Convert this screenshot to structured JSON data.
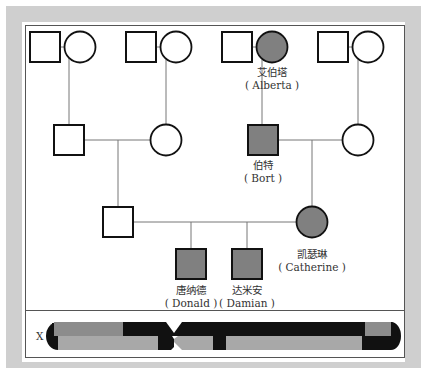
{
  "diagram": {
    "type": "pedigree",
    "colors": {
      "affected_fill": "#808080",
      "unaffected_fill": "#ffffff",
      "stroke": "#111111",
      "line": "#777777",
      "frame": "#cfcfcf",
      "chromosome_black": "#111111",
      "chromosome_dark_gray": "#8c8c8c",
      "chromosome_light_gray": "#a8a8a8"
    },
    "generations": [
      {
        "row": 1,
        "individuals": [
          {
            "id": "g1-m1",
            "sex": "male",
            "affected": false
          },
          {
            "id": "g1-f1",
            "sex": "female",
            "affected": false
          },
          {
            "id": "g1-m2",
            "sex": "male",
            "affected": false
          },
          {
            "id": "g1-f2",
            "sex": "female",
            "affected": false
          },
          {
            "id": "g1-m3",
            "sex": "male",
            "affected": false
          },
          {
            "id": "alberta",
            "sex": "female",
            "affected": true,
            "name_cn": "艾伯塔",
            "name_en": "( Alberta )"
          },
          {
            "id": "g1-m4",
            "sex": "male",
            "affected": false
          },
          {
            "id": "g1-f4",
            "sex": "female",
            "affected": false
          }
        ]
      },
      {
        "row": 2,
        "individuals": [
          {
            "id": "g2-m1",
            "sex": "male",
            "affected": false
          },
          {
            "id": "g2-f1",
            "sex": "female",
            "affected": false
          },
          {
            "id": "bort",
            "sex": "male",
            "affected": true,
            "name_cn": "伯特",
            "name_en": "( Bort )"
          },
          {
            "id": "g2-f2",
            "sex": "female",
            "affected": false
          }
        ]
      },
      {
        "row": 3,
        "individuals": [
          {
            "id": "g3-m1",
            "sex": "male",
            "affected": false
          },
          {
            "id": "catherine",
            "sex": "female",
            "affected": true,
            "name_cn": "凯瑟琳",
            "name_en": "( Catherine )"
          }
        ]
      },
      {
        "row": 4,
        "individuals": [
          {
            "id": "donald",
            "sex": "male",
            "affected": true,
            "name_cn": "唐纳德",
            "name_en": "( Donald )"
          },
          {
            "id": "damian",
            "sex": "male",
            "affected": true,
            "name_cn": "达米安",
            "name_en": "( Damian )"
          }
        ]
      }
    ],
    "chromosome": {
      "label": "X"
    }
  }
}
